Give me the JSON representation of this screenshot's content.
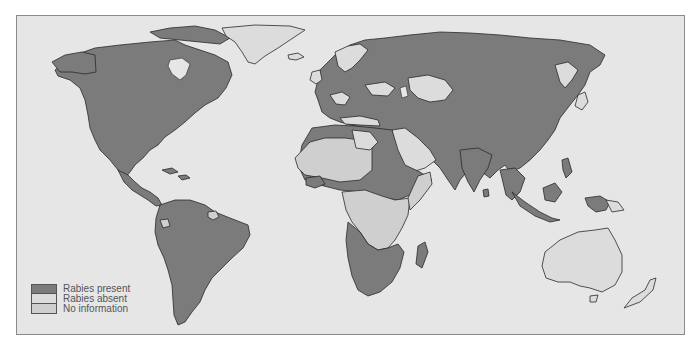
{
  "map": {
    "title": "",
    "colors": {
      "ocean": "#e6e6e6",
      "present": "#7b7b7b",
      "absent": "#dcdcdc",
      "no_information": "#cfcfcf",
      "border": "#2a2a2a"
    }
  },
  "legend": {
    "items": [
      {
        "label": "Rabies present",
        "color": "#7b7b7b"
      },
      {
        "label": "Rabies absent",
        "color": "#dcdcdc"
      },
      {
        "label": "No information",
        "color": "#cfcfcf"
      }
    ]
  }
}
